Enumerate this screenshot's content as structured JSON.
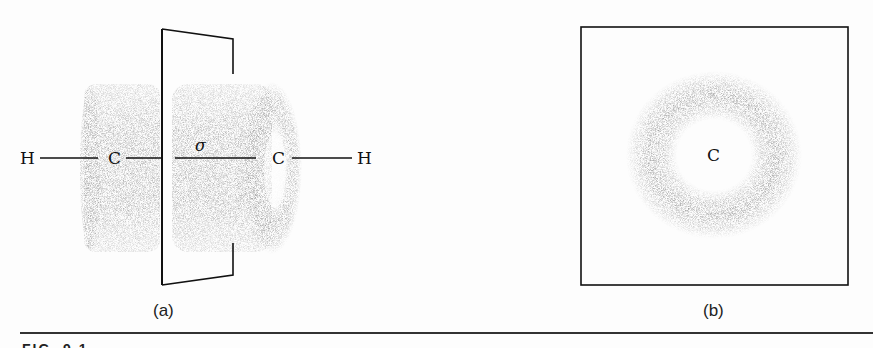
{
  "panel_a": {
    "caption": "(a)",
    "atoms": {
      "h_left": "H",
      "c_left": "C",
      "c_right": "C",
      "h_right": "H"
    },
    "bond_label": "σ",
    "description": "H–C–C–H molecule with cylindrical electron clouds on each side of a nodal plane"
  },
  "panel_b": {
    "caption": "(b)",
    "center_atom": "C",
    "description": "End-on view showing a ring-shaped electron density around carbon"
  },
  "figure_number": "FIG. 9.1"
}
